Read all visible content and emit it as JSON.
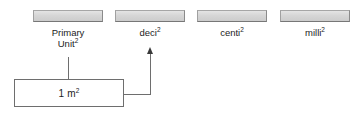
{
  "diagram": {
    "columns": [
      {
        "id": "primary-unit",
        "label": "Primary\nUnit",
        "exponent": "2",
        "header_fill": "#d6d6d6"
      },
      {
        "id": "deci",
        "label": "deci",
        "exponent": "2",
        "header_fill": "#d6d6d6"
      },
      {
        "id": "centi",
        "label": "centi",
        "exponent": "2",
        "header_fill": "#d6d6d6"
      },
      {
        "id": "milli",
        "label": "milli",
        "exponent": "2",
        "header_fill": "#d6d6d6"
      }
    ],
    "value_box": {
      "text": "1 m",
      "exponent": "2"
    },
    "connectors": {
      "stem_label": "primary-unit-stem",
      "arrow_label": "deci-arrow",
      "arrow_direction": "up"
    },
    "colors": {
      "line": "#6e6e6e",
      "arrow": "#3a3a3a",
      "text": "#1c1c1c",
      "header_border": "#8d8d8d",
      "background": "#ffffff"
    }
  }
}
